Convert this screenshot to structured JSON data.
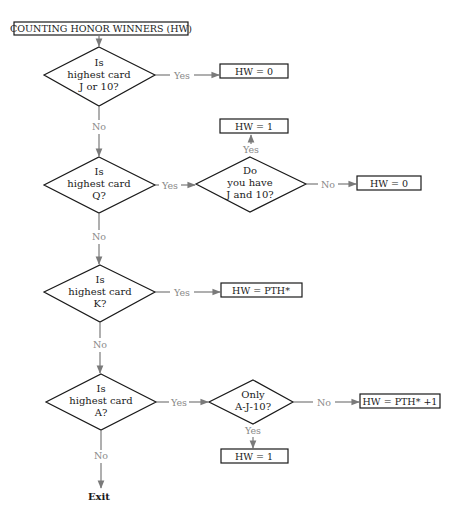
{
  "title": "COUNTING HONOR WINNERS (HW)",
  "colors": {
    "shape_stroke": "#1a1a1a",
    "connector": "#7a7a7a",
    "label": "#8a8a8a",
    "background": "#ffffff"
  },
  "decisions": [
    {
      "id": "d1",
      "lines": [
        "Is",
        "highest card",
        "J or 10?"
      ]
    },
    {
      "id": "d2",
      "lines": [
        "Is",
        "highest card",
        "Q?"
      ]
    },
    {
      "id": "d2b",
      "lines": [
        "Do",
        "you have",
        "J and 10?"
      ]
    },
    {
      "id": "d3",
      "lines": [
        "Is",
        "highest card",
        "K?"
      ]
    },
    {
      "id": "d4",
      "lines": [
        "Is",
        "highest card",
        "A?"
      ]
    },
    {
      "id": "d4b",
      "lines": [
        "Only",
        "A-J-10?"
      ]
    }
  ],
  "outcomes": {
    "d1_yes": "HW = 0",
    "d2b_yes": "HW = 1",
    "d2b_no": "HW = 0",
    "d3_yes": "HW = PTH*",
    "d4b_no": "HW = PTH* +1",
    "d4b_yes": "HW = 1"
  },
  "labels": {
    "yes": "Yes",
    "no": "No"
  },
  "exit_label": "Exit"
}
